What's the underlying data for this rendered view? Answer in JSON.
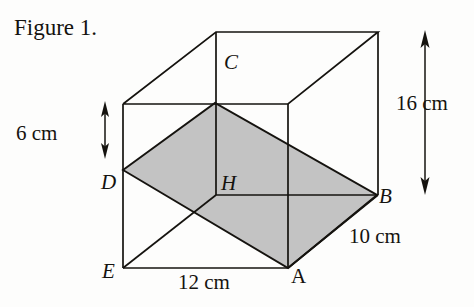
{
  "figure": {
    "caption": "Figure 1.",
    "type": "3d-geometry-cuboid-with-shaded-cross-section",
    "vertex_labels": [
      {
        "name": "C",
        "text": "C",
        "x": 224,
        "y": 52,
        "style": "italic"
      },
      {
        "name": "D",
        "text": "D",
        "x": 101,
        "y": 172,
        "style": "italic"
      },
      {
        "name": "H",
        "text": "H",
        "x": 221,
        "y": 173,
        "style": "italic"
      },
      {
        "name": "B",
        "text": "B",
        "x": 379,
        "y": 186,
        "style": "italic"
      },
      {
        "name": "E",
        "text": "E",
        "x": 102,
        "y": 261,
        "style": "italic"
      },
      {
        "name": "A",
        "text": "A",
        "x": 291,
        "y": 266,
        "style": "upright"
      }
    ],
    "dimensions": [
      {
        "name": "height-right",
        "text": "16 cm",
        "value": 16,
        "unit": "cm",
        "x": 396,
        "y": 93
      },
      {
        "name": "height-left-segment",
        "text": "6 cm",
        "value": 6,
        "unit": "cm",
        "x": 16,
        "y": 123
      },
      {
        "name": "depth-front-right",
        "text": "10 cm",
        "value": 10,
        "unit": "cm",
        "x": 349,
        "y": 226
      },
      {
        "name": "width-bottom-front",
        "text": "12 cm",
        "value": 12,
        "unit": "cm",
        "x": 178,
        "y": 272
      }
    ],
    "colors": {
      "line": "#15130f",
      "shade_fill": "#c3c3c3",
      "background": "#fdfdfc",
      "text": "#15130f"
    },
    "geometry": {
      "cuboid_vertices": {
        "top_back_left": [
          216,
          32
        ],
        "top_back_right": [
          378,
          32
        ],
        "top_front_left": [
          123,
          104
        ],
        "top_front_right": [
          288,
          104
        ],
        "bottom_back_left": [
          216,
          195
        ],
        "bottom_back_right": [
          378,
          195
        ],
        "bottom_front_left": [
          123,
          268
        ],
        "bottom_front_right": [
          288,
          268
        ]
      },
      "shaded_quadrilateral": [
        [
          123,
          170
        ],
        [
          215,
          103
        ],
        [
          377,
          195
        ],
        [
          288,
          268
        ]
      ],
      "arrow_16cm": {
        "x": 425,
        "y1": 33,
        "y2": 192
      },
      "arrow_6cm": {
        "x": 105,
        "y1": 104,
        "y2": 156
      }
    }
  }
}
